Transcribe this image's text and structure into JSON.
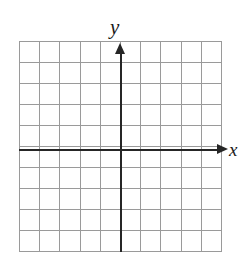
{
  "figure": {
    "kind": "cartesian-coordinate-grid",
    "width": 244,
    "height": 264,
    "background_color": "#ffffff"
  },
  "axes": {
    "x_axis_label": "x",
    "y_axis_label": "y",
    "axis_color": "#262626",
    "x_axis_arrow": "arrow-right-icon",
    "y_axis_arrow": "arrow-up-icon"
  },
  "grid": {
    "color": "#9a9a9a",
    "columns": 10,
    "rows": 10,
    "left": 19,
    "top": 41,
    "width": 203,
    "height": 211,
    "cell_width": 20.3,
    "cell_height": 21.1,
    "origin_x": 121,
    "origin_y": 150,
    "tick_labels": []
  },
  "chart_data": {
    "type": "scatter",
    "title": "",
    "subtitle": "",
    "xlabel": "x",
    "ylabel": "y",
    "xlim": [
      -5,
      5
    ],
    "ylim": [
      -5,
      5
    ],
    "xticks": [
      -5,
      -4,
      -3,
      -2,
      -1,
      0,
      1,
      2,
      3,
      4,
      5
    ],
    "yticks": [
      -5,
      -4,
      -3,
      -2,
      -1,
      0,
      1,
      2,
      3,
      4,
      5
    ],
    "xtick_labels": [],
    "ytick_labels": [],
    "grid": true,
    "grid_columns": 10,
    "grid_rows": 10,
    "legend": null,
    "legend_position": null,
    "annotations": [],
    "series": [],
    "x": [],
    "values": [],
    "note": "Blank coordinate plane: 10 by 10 grid of unit squares with x and y axes through the center, no plotted data points."
  }
}
